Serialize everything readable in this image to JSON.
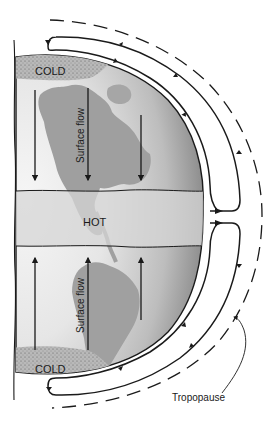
{
  "diagram": {
    "type": "single-cell atmospheric circulation (Hadley) on a non-rotating Earth",
    "labels": {
      "cold_top": "COLD",
      "cold_bottom": "COLD",
      "hot": "HOT",
      "surface_flow_top": "Surface flow",
      "surface_flow_bottom": "Surface flow",
      "tropopause": "Tropopause"
    },
    "regions": [
      {
        "name": "north-polar-cold-cap",
        "label": "COLD"
      },
      {
        "name": "equatorial-hot-band",
        "label": "HOT"
      },
      {
        "name": "south-polar-cold-cap",
        "label": "COLD"
      }
    ],
    "flows": [
      {
        "name": "northern-surface-flow",
        "direction": "toward equator (down)"
      },
      {
        "name": "southern-surface-flow",
        "direction": "toward equator (up)"
      },
      {
        "name": "northern-upper-cell",
        "direction": "rising at equator, poleward aloft, sinking at pole"
      },
      {
        "name": "southern-upper-cell",
        "direction": "rising at equator, poleward aloft, sinking at pole"
      }
    ],
    "colors": {
      "ink": "#1a1a1a",
      "globe_light": "#f4f4f4",
      "globe_dark": "#9a9a9a",
      "land": "#9c9c9c",
      "hot_band": "#d2d2d2",
      "cold_cap": "#b4b4b4"
    }
  }
}
